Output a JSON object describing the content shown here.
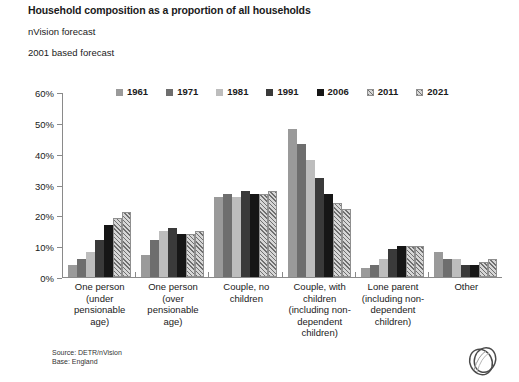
{
  "header": {
    "title": "Household composition as a proportion of all households",
    "subtitle_1": "nVision forecast",
    "subtitle_2": "2001 based forecast"
  },
  "footer": {
    "source": "Source: DETR/nVision",
    "base": "Base: England",
    "logo_name": "nvision-rings-logo"
  },
  "chart_data": {
    "type": "bar",
    "title": "Household composition as a proportion of all households",
    "xlabel": "",
    "ylabel": "",
    "ylim": [
      0,
      60
    ],
    "ytick_labels": [
      "60%",
      "50%",
      "40%",
      "30%",
      "20%",
      "10%",
      "0%"
    ],
    "ytick_values": [
      60,
      50,
      40,
      30,
      20,
      10,
      0
    ],
    "grid": false,
    "legend_position": "top",
    "unit": "%",
    "categories": [
      "One person (under pensionable age)",
      "One person (over pensionable age)",
      "Couple, no children",
      "Couple, with children (including non-dependent children)",
      "Lone parent (including non-dependent children)",
      "Other"
    ],
    "series": [
      {
        "name": "1961",
        "color": "#9a9a9a",
        "pattern": "solid",
        "values": [
          4,
          7,
          26,
          48,
          3,
          8
        ]
      },
      {
        "name": "1971",
        "color": "#6e6e6e",
        "pattern": "solid",
        "values": [
          6,
          12,
          27,
          43,
          4,
          6
        ]
      },
      {
        "name": "1981",
        "color": "#bdbdbd",
        "pattern": "solid",
        "values": [
          8,
          15,
          26,
          38,
          6,
          6
        ]
      },
      {
        "name": "1991",
        "color": "#3a3a3a",
        "pattern": "solid",
        "values": [
          12,
          16,
          28,
          32,
          9,
          4
        ]
      },
      {
        "name": "2006",
        "color": "#161616",
        "pattern": "solid",
        "values": [
          17,
          14,
          27,
          27,
          10,
          4
        ]
      },
      {
        "name": "2011",
        "color": "#d6d6d6",
        "pattern": "hatch",
        "values": [
          19,
          14,
          27,
          24,
          10,
          5
        ]
      },
      {
        "name": "2021",
        "color": "#d6d6d6",
        "pattern": "hatch",
        "values": [
          21,
          15,
          28,
          22,
          10,
          6
        ]
      }
    ]
  }
}
